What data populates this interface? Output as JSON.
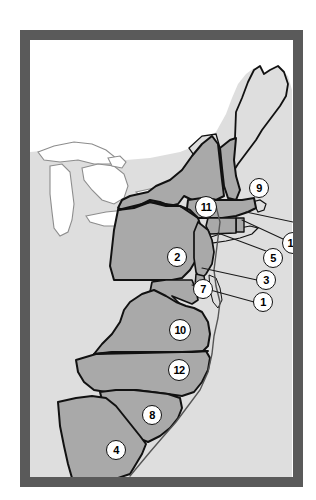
{
  "figure": {
    "alt": "Black and white framed map of the eastern seaboard of North America showing the thirteen British colonies shaded in gray with numbered circular key labels"
  },
  "colors": {
    "frame": "#6b6b6b",
    "frame_edge": "#5a5a5a",
    "colony_fill": "#a9a9a9",
    "land_background": "#dedede",
    "water": "#ffffff",
    "outline": "#111111",
    "badge_fill": "#ffffff",
    "badge_text": "#000000",
    "leader_line": "#1a1a1a"
  },
  "map": {
    "projection_note": "eastern North America, Great Lakes to Florida",
    "water_features": [
      "Atlantic Ocean",
      "Great Lakes"
    ],
    "badges": [
      {
        "id": "badge-1",
        "label": "1",
        "x": 233,
        "y": 262,
        "wide": false,
        "leader": true,
        "leader_to_x": 162,
        "leader_to_y": 245
      },
      {
        "id": "badge-2",
        "label": "2",
        "x": 147,
        "y": 217,
        "wide": false,
        "leader": false
      },
      {
        "id": "badge-3",
        "label": "3",
        "x": 236,
        "y": 240,
        "wide": false,
        "leader": true,
        "leader_to_x": 172,
        "leader_to_y": 228
      },
      {
        "id": "badge-4",
        "label": "4",
        "x": 86,
        "y": 410,
        "wide": false,
        "leader": false
      },
      {
        "id": "badge-5",
        "label": "5",
        "x": 243,
        "y": 218,
        "wide": false,
        "leader": true,
        "leader_to_x": 188,
        "leader_to_y": 193
      },
      {
        "id": "badge-6",
        "label": "6",
        "x": 277,
        "y": 185,
        "wide": false,
        "leader": true,
        "leader_to_x": 216,
        "leader_to_y": 172
      },
      {
        "id": "badge-7",
        "label": "7",
        "x": 173,
        "y": 249,
        "wide": false,
        "leader": false
      },
      {
        "id": "badge-8",
        "label": "8",
        "x": 122,
        "y": 375,
        "wide": false,
        "leader": false
      },
      {
        "id": "badge-9",
        "label": "9",
        "x": 229,
        "y": 148,
        "wide": false,
        "leader": false
      },
      {
        "id": "badge-10",
        "label": "10",
        "x": 150,
        "y": 290,
        "wide": true,
        "leader": false
      },
      {
        "id": "badge-11",
        "label": "11",
        "x": 176,
        "y": 167,
        "wide": true,
        "leader": false
      },
      {
        "id": "badge-12",
        "label": "12",
        "x": 149,
        "y": 330,
        "wide": true,
        "leader": false
      },
      {
        "id": "badge-13",
        "label": "13",
        "x": 263,
        "y": 203,
        "wide": true,
        "leader": true,
        "leader_to_x": 212,
        "leader_to_y": 180
      }
    ]
  }
}
